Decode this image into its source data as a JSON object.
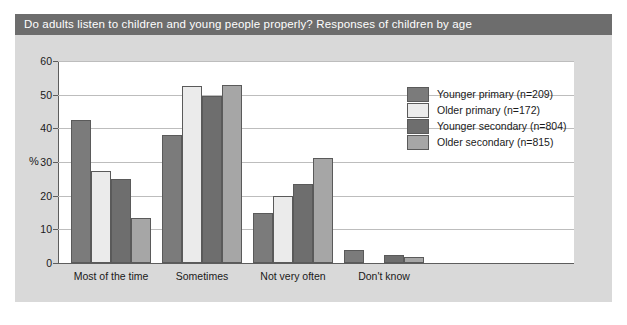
{
  "figure": {
    "title": "Do adults listen to children and young people properly? Responses of children by age",
    "title_bar_color": "#6d6d6d",
    "title_text_color": "#ffffff",
    "background_color": "#d9d9d9",
    "plot_background_color": "#ffffff"
  },
  "chart_data": {
    "type": "bar",
    "title": "Do adults listen to children and young people properly? Responses of children by age",
    "xlabel": "",
    "ylabel": "%",
    "ylim": [
      0,
      60
    ],
    "yticks": [
      0,
      10,
      20,
      30,
      40,
      50,
      60
    ],
    "ytick_labels": [
      "0",
      "10",
      "20",
      "30",
      "40",
      "50",
      "60"
    ],
    "grid": true,
    "legend_position": "upper right",
    "categories": [
      "Most of the time",
      "Sometimes",
      "Not very often",
      "Don't know"
    ],
    "series": [
      {
        "name": "Younger primary (n=209)",
        "color": "#7b7b7b",
        "values": [
          42.5,
          38.0,
          15.0,
          4.0
        ]
      },
      {
        "name": "Older primary (n=172)",
        "color": "#ebebeb",
        "values": [
          27.2,
          52.7,
          20.0,
          0.0
        ]
      },
      {
        "name": "Younger secondary (n=804)",
        "color": "#6e6e6e",
        "values": [
          25.0,
          49.5,
          23.5,
          2.3
        ]
      },
      {
        "name": "Older secondary (n=815)",
        "color": "#a6a6a6",
        "values": [
          13.5,
          53.0,
          31.2,
          1.8
        ]
      }
    ]
  }
}
